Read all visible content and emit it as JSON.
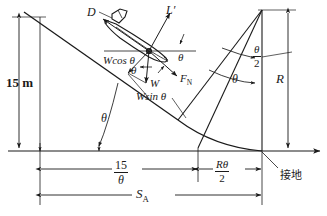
{
  "figure": {
    "stroke_color": "#1a1a1a",
    "background": "#ffffff"
  },
  "labels": {
    "screen_height": "15 m",
    "drag": "D",
    "lift": "L′",
    "weight_cos": "Wcos θ",
    "weight_sin": "Wsin θ",
    "weight": "W",
    "normal_force": "F",
    "normal_force_sub": "N",
    "theta": "θ",
    "theta_slope": "θ",
    "theta_body_left": "θ",
    "theta_body_lower": "θ",
    "theta_body_right": "θ",
    "theta_right_lower": "θ",
    "radius": "R",
    "touchdown": "接地",
    "approach_num": "15",
    "approach_den": "θ",
    "flare_num": "Rθ",
    "flare_den": "2",
    "half_theta_num": "θ",
    "half_theta_den": "2",
    "total_distance": "S",
    "total_distance_sub": "A"
  }
}
